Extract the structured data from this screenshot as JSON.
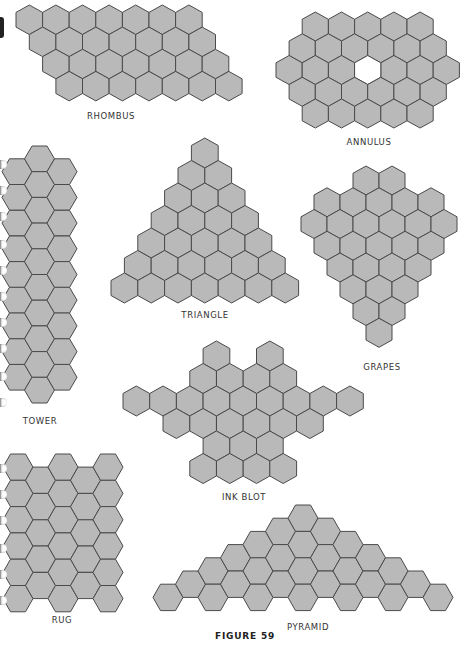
{
  "figure": {
    "caption": "FIGURE 59",
    "caption_x": 245,
    "caption_y": 631
  },
  "style": {
    "hex_fill": "#b9b9b9",
    "hex_stroke": "#4a4a4a",
    "label_color": "#333333",
    "background": "#ffffff"
  },
  "shapes": [
    {
      "id": "rhombus",
      "label": "RHOMBUS",
      "label_x": 111,
      "label_y": 111,
      "orientation": "pointy",
      "w": 26.6,
      "h": 29.5,
      "origin": [
        16,
        5
      ],
      "rows": [
        {
          "offset": 0,
          "cells": [
            0,
            1,
            2,
            3,
            4,
            5,
            6
          ]
        },
        {
          "offset": 0.5,
          "cells": [
            0,
            1,
            2,
            3,
            4,
            5,
            6
          ]
        },
        {
          "offset": 1,
          "cells": [
            0,
            1,
            2,
            3,
            4,
            5,
            6
          ]
        },
        {
          "offset": 1.5,
          "cells": [
            0,
            1,
            2,
            3,
            4,
            5,
            6
          ]
        }
      ]
    },
    {
      "id": "annulus",
      "label": "ANNULUS",
      "label_x": 369,
      "label_y": 137,
      "orientation": "pointy",
      "w": 26.2,
      "h": 29,
      "origin": [
        276,
        12
      ],
      "rows": [
        {
          "offset": 1,
          "cells": [
            0,
            1,
            2,
            3,
            4
          ]
        },
        {
          "offset": 0.5,
          "cells": [
            0,
            1,
            2,
            3,
            4,
            5
          ]
        },
        {
          "offset": 0,
          "cells": [
            0,
            1,
            2,
            4,
            5,
            6
          ],
          "hole": [
            3
          ]
        },
        {
          "offset": 0.5,
          "cells": [
            0,
            1,
            2,
            3,
            4,
            5
          ]
        },
        {
          "offset": 1,
          "cells": [
            0,
            1,
            2,
            3,
            4
          ]
        }
      ]
    },
    {
      "id": "triangle",
      "label": "TRIANGLE",
      "label_x": 205,
      "label_y": 310,
      "orientation": "pointy",
      "w": 26.8,
      "h": 30,
      "origin": [
        111,
        138
      ],
      "rows": [
        {
          "offset": 3,
          "cells": [
            0
          ]
        },
        {
          "offset": 2.5,
          "cells": [
            0,
            1
          ]
        },
        {
          "offset": 2,
          "cells": [
            0,
            1,
            2
          ]
        },
        {
          "offset": 1.5,
          "cells": [
            0,
            1,
            2,
            3
          ]
        },
        {
          "offset": 1,
          "cells": [
            0,
            1,
            2,
            3,
            4
          ]
        },
        {
          "offset": 0.5,
          "cells": [
            0,
            1,
            2,
            3,
            4,
            5
          ]
        },
        {
          "offset": 0,
          "cells": [
            0,
            1,
            2,
            3,
            4,
            5,
            6
          ]
        }
      ]
    },
    {
      "id": "grapes",
      "label": "GRAPES",
      "label_x": 382,
      "label_y": 362,
      "orientation": "pointy",
      "w": 26,
      "h": 29,
      "origin": [
        301,
        166
      ],
      "rows": [
        {
          "offset": 2,
          "cells": [
            0,
            1
          ]
        },
        {
          "offset": 0.5,
          "cells": [
            0,
            1,
            2,
            3,
            4
          ]
        },
        {
          "offset": 0,
          "cells": [
            0,
            1,
            2,
            3,
            4,
            5
          ]
        },
        {
          "offset": 0.5,
          "cells": [
            0,
            1,
            2,
            3,
            4
          ]
        },
        {
          "offset": 1,
          "cells": [
            0,
            1,
            2,
            3
          ]
        },
        {
          "offset": 1.5,
          "cells": [
            0,
            1,
            2
          ]
        },
        {
          "offset": 2,
          "cells": [
            0,
            1
          ]
        },
        {
          "offset": 2.5,
          "cells": [
            0
          ]
        }
      ]
    },
    {
      "id": "ink-blot",
      "label": "INK BLOT",
      "label_x": 244,
      "label_y": 492,
      "orientation": "pointy",
      "w": 26.7,
      "h": 30,
      "origin": [
        123,
        341
      ],
      "rows": [
        {
          "offset": 3,
          "cells": [
            0,
            2
          ]
        },
        {
          "offset": 2.5,
          "cells": [
            0,
            1,
            2,
            3
          ]
        },
        {
          "offset": 0,
          "cells": [
            0,
            1,
            2,
            3,
            4,
            5,
            6,
            7,
            8
          ]
        },
        {
          "offset": 1.5,
          "cells": [
            0,
            1,
            2,
            3,
            4,
            5
          ]
        },
        {
          "offset": 3,
          "cells": [
            0,
            1,
            2
          ]
        },
        {
          "offset": 2.5,
          "cells": [
            0,
            1,
            2,
            3
          ]
        }
      ]
    },
    {
      "id": "tower",
      "label": "TOWER",
      "label_x": 40,
      "label_y": 416,
      "orientation": "flat",
      "w": 30,
      "h": 25.7,
      "origin": [
        2,
        146
      ],
      "cols": [
        {
          "offset": 0.5,
          "cells": [
            0,
            1,
            2,
            3,
            4,
            5,
            6,
            7,
            8
          ]
        },
        {
          "offset": 0,
          "cells": [
            0,
            1,
            2,
            3,
            4,
            5,
            6,
            7,
            8,
            9
          ]
        },
        {
          "offset": 0.5,
          "cells": [
            0,
            1,
            2,
            3,
            4,
            5,
            6,
            7,
            8
          ]
        }
      ]
    },
    {
      "id": "rug",
      "label": "RUG",
      "label_x": 62,
      "label_y": 615,
      "orientation": "flat",
      "w": 30,
      "h": 26.3,
      "origin": [
        3,
        454
      ],
      "cols": [
        {
          "offset": 0,
          "cells": [
            0,
            1,
            2,
            3,
            4,
            5
          ]
        },
        {
          "offset": 0.5,
          "cells": [
            0,
            1,
            2,
            3,
            4
          ]
        },
        {
          "offset": 0,
          "cells": [
            0,
            1,
            2,
            3,
            4,
            5
          ]
        },
        {
          "offset": 0.5,
          "cells": [
            0,
            1,
            2,
            3,
            4
          ]
        },
        {
          "offset": 0,
          "cells": [
            0,
            1,
            2,
            3,
            4,
            5
          ]
        }
      ]
    },
    {
      "id": "pyramid",
      "label": "PYRAMID",
      "label_x": 308,
      "label_y": 622,
      "orientation": "flat",
      "w": 30,
      "h": 26.4,
      "origin": [
        153,
        505
      ],
      "cols": [
        {
          "offset": 3,
          "cells": [
            0
          ]
        },
        {
          "offset": 2.5,
          "cells": [
            0
          ]
        },
        {
          "offset": 2,
          "cells": [
            0,
            1
          ]
        },
        {
          "offset": 1.5,
          "cells": [
            0,
            1
          ]
        },
        {
          "offset": 1,
          "cells": [
            0,
            1,
            2
          ]
        },
        {
          "offset": 0.5,
          "cells": [
            0,
            1,
            2
          ]
        },
        {
          "offset": 0,
          "cells": [
            0,
            1,
            2,
            3
          ]
        },
        {
          "offset": 0.5,
          "cells": [
            0,
            1,
            2
          ]
        },
        {
          "offset": 1,
          "cells": [
            0,
            1,
            2
          ]
        },
        {
          "offset": 1.5,
          "cells": [
            0,
            1
          ]
        },
        {
          "offset": 2,
          "cells": [
            0,
            1
          ]
        },
        {
          "offset": 2.5,
          "cells": [
            0
          ]
        },
        {
          "offset": 3,
          "cells": [
            0
          ]
        }
      ]
    }
  ],
  "binding_holes": [
    160,
    186,
    212,
    240,
    266,
    292,
    318,
    344,
    372,
    398,
    464,
    490,
    516,
    544,
    570,
    596
  ]
}
